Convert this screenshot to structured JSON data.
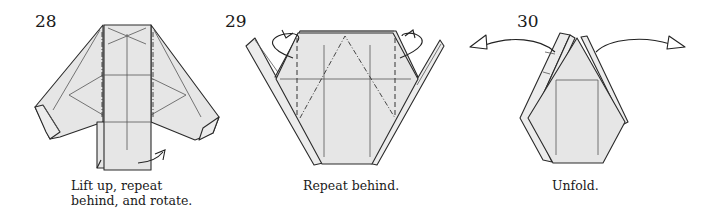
{
  "steps": [
    {
      "number": "28",
      "caption_lines": [
        "Lift up, repeat",
        "behind, and rotate."
      ],
      "symbols": [
        "mountain-fold-lines",
        "lift-up-arrow"
      ]
    },
    {
      "number": "29",
      "caption_lines": [
        "Repeat behind."
      ],
      "symbols": [
        "valley-fold-lines",
        "mountain-fold-lines",
        "tuck-behind-arrows"
      ]
    },
    {
      "number": "30",
      "caption_lines": [
        "Unfold."
      ],
      "symbols": [
        "unfold-arrows"
      ]
    }
  ],
  "colors": {
    "paper": "#e6e6e6",
    "line": "#2a2a2a",
    "background": "#ffffff"
  }
}
